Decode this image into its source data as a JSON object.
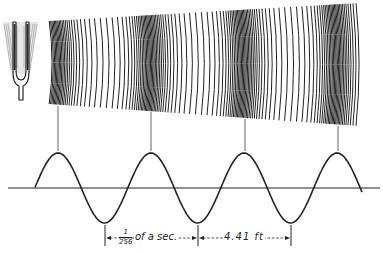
{
  "figure": {
    "labels": {
      "period_fraction_numerator": "1",
      "period_fraction_denominator": "256",
      "period_suffix": "of a sec.",
      "wavelength": "4.41 ft"
    },
    "colors": {
      "ink": "#222222",
      "light_ink": "#555555",
      "background": "#ffffff"
    }
  },
  "geometry": {
    "baseline": {
      "y": 188,
      "x1": 8,
      "x2": 380
    },
    "sine": {
      "x_start": 35,
      "x_end": 362,
      "amplitude": 35,
      "period": 93,
      "peak_x0": 58
    },
    "compression_centers": [
      57,
      151,
      245,
      338
    ],
    "wave_field": {
      "x_start": 52,
      "x_end": 362,
      "top_left": 21,
      "top_right": 3,
      "bottom_left": 104,
      "bottom_right": 126,
      "arc_center_x": -260
    },
    "connectors": [
      {
        "x": 58,
        "y1": 106,
        "y2": 151
      },
      {
        "x": 151,
        "y1": 112,
        "y2": 151
      },
      {
        "x": 245,
        "y1": 119,
        "y2": 151
      },
      {
        "x": 338,
        "y1": 126,
        "y2": 151
      }
    ],
    "dimension": {
      "y": 238,
      "ticks": [
        105,
        198,
        291
      ],
      "tick_top": 225,
      "tick_bottom": 246
    }
  }
}
